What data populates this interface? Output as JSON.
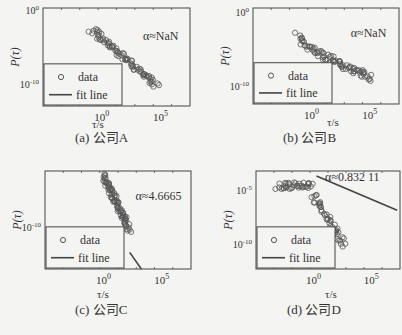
{
  "chart_data": [
    {
      "id": "a",
      "type": "scatter",
      "caption": "(a) 公司A",
      "xlabel": "τ/s",
      "ylabel": "P(τ)",
      "xscale": "log",
      "yscale": "log",
      "xticks": [
        "10^0",
        "10^5"
      ],
      "yticks": [
        "10^0",
        "10^-10"
      ],
      "annotation": "α≈NaN",
      "legend": {
        "entries": [
          "data",
          "fit line"
        ],
        "position": "lower left"
      },
      "fit_line": null,
      "series": [
        {
          "name": "data",
          "description": "decreasing power-law-like tail from ~τ=10^0 to ~10^4, P from ~10^-1 to ~10^-9"
        }
      ]
    },
    {
      "id": "b",
      "type": "scatter",
      "caption": "(b) 公司B",
      "xlabel": "τ/s",
      "ylabel": "P(τ)",
      "xscale": "log",
      "yscale": "log",
      "xticks": [
        "10^0",
        "10^5"
      ],
      "yticks": [
        "10^0",
        "10^-10"
      ],
      "annotation": "α≈NaN",
      "legend": {
        "entries": [
          "data",
          "fit line"
        ],
        "position": "lower left"
      },
      "fit_line": null,
      "series": [
        {
          "name": "data",
          "description": "decreasing from ~10^0 at τ≈10^0 to ~10^-7 at τ≈10^4.5"
        }
      ]
    },
    {
      "id": "c",
      "type": "scatter",
      "caption": "(c) 公司C",
      "xlabel": "τ/s",
      "ylabel": "P(τ)",
      "xscale": "log",
      "yscale": "log",
      "xticks": [
        "10^0",
        "10^5"
      ],
      "yticks": [
        "10^-10"
      ],
      "annotation": "α≈4.6665",
      "legend": {
        "entries": [
          "data",
          "fit line"
        ],
        "position": "lower left"
      },
      "fit_line": "steep line near bottom around τ≈10^3",
      "series": [
        {
          "name": "data",
          "description": "steep decline from top at τ≈10^1.5 to ~10^-9 at τ≈10^3.5"
        }
      ]
    },
    {
      "id": "d",
      "type": "scatter",
      "caption": "(d) 公司D",
      "xlabel": "τ/s",
      "ylabel": "P(τ)",
      "xscale": "log",
      "yscale": "log",
      "xticks": [
        "10^0",
        "10^5"
      ],
      "yticks": [
        "10^-5",
        "10^-10"
      ],
      "annotation": "α≈0.832 11",
      "legend": {
        "entries": [
          "data",
          "fit line"
        ],
        "position": "lower left"
      },
      "fit_line": "line from τ≈10^2.5 (P≈10^-4.5) to τ≈10^7 (P≈10^-8)",
      "series": [
        {
          "name": "data",
          "description": "plateau ~10^-5 for τ 10^0–10^2.5, then drops to ~10^-11 at τ≈10^4.7"
        }
      ]
    }
  ]
}
